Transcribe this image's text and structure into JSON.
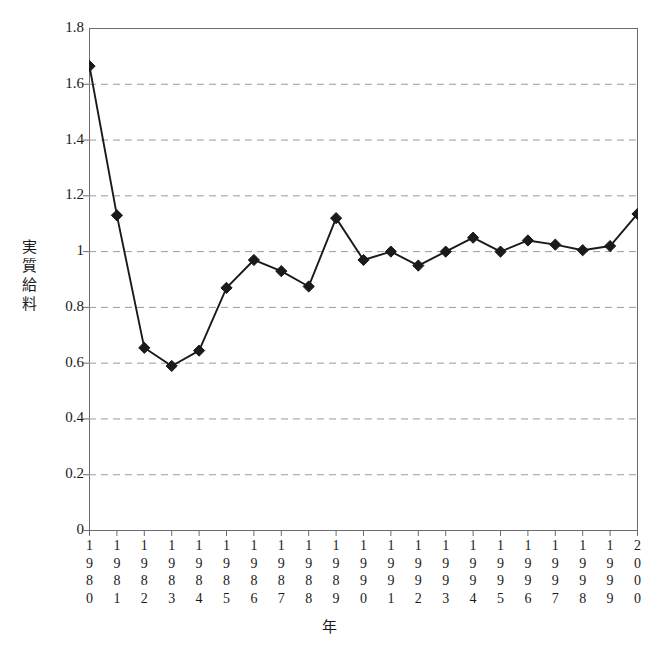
{
  "figure": {
    "background_color": "#ffffff",
    "frame_color": "#6b6b70",
    "series_color": "#1a1a1a",
    "grid_color": "#9a9aa0",
    "scan_sliver_text": " "
  },
  "chart_data": {
    "type": "line",
    "title": "",
    "xlabel": "年",
    "ylabel": "実質給料",
    "ylabel_chars": [
      "実",
      "質",
      "給",
      "料"
    ],
    "xlim": [
      1980,
      2000
    ],
    "ylim": [
      0,
      1.8
    ],
    "ytick_values": [
      0,
      0.2,
      0.4,
      0.6,
      0.8,
      1,
      1.2,
      1.4,
      1.6,
      1.8
    ],
    "ytick_labels": [
      "0",
      "0.2",
      "0.4",
      "0.6",
      "0.8",
      "1",
      "1.2",
      "1.4",
      "1.6",
      "1.8"
    ],
    "grid": "horizontal-dashed",
    "legend": "none",
    "marker": "diamond",
    "categories": [
      "1980",
      "1981",
      "1982",
      "1983",
      "1984",
      "1985",
      "1986",
      "1987",
      "1988",
      "1989",
      "1990",
      "1991",
      "1992",
      "1993",
      "1994",
      "1995",
      "1996",
      "1997",
      "1998",
      "1999",
      "2000"
    ],
    "category_char_stacks": [
      [
        "1",
        "9",
        "8",
        "0"
      ],
      [
        "1",
        "9",
        "8",
        "1"
      ],
      [
        "1",
        "9",
        "8",
        "2"
      ],
      [
        "1",
        "9",
        "8",
        "3"
      ],
      [
        "1",
        "9",
        "8",
        "4"
      ],
      [
        "1",
        "9",
        "8",
        "5"
      ],
      [
        "1",
        "9",
        "8",
        "6"
      ],
      [
        "1",
        "9",
        "8",
        "7"
      ],
      [
        "1",
        "9",
        "8",
        "8"
      ],
      [
        "1",
        "9",
        "8",
        "9"
      ],
      [
        "1",
        "9",
        "9",
        "0"
      ],
      [
        "1",
        "9",
        "9",
        "1"
      ],
      [
        "1",
        "9",
        "9",
        "2"
      ],
      [
        "1",
        "9",
        "9",
        "3"
      ],
      [
        "1",
        "9",
        "9",
        "4"
      ],
      [
        "1",
        "9",
        "9",
        "5"
      ],
      [
        "1",
        "9",
        "9",
        "6"
      ],
      [
        "1",
        "9",
        "9",
        "7"
      ],
      [
        "1",
        "9",
        "9",
        "8"
      ],
      [
        "1",
        "9",
        "9",
        "9"
      ],
      [
        "2",
        "0",
        "0",
        "0"
      ]
    ],
    "values": [
      1.665,
      1.13,
      0.655,
      0.59,
      0.645,
      0.87,
      0.97,
      0.93,
      0.875,
      1.12,
      0.97,
      1.0,
      0.95,
      1.0,
      1.05,
      1.0,
      1.04,
      1.025,
      1.005,
      1.02,
      1.135
    ],
    "series": [
      {
        "name": "実質給料",
        "values": [
          1.665,
          1.13,
          0.655,
          0.59,
          0.645,
          0.87,
          0.97,
          0.93,
          0.875,
          1.12,
          0.97,
          1.0,
          0.95,
          1.0,
          1.05,
          1.0,
          1.04,
          1.025,
          1.005,
          1.02,
          1.135
        ]
      }
    ]
  }
}
